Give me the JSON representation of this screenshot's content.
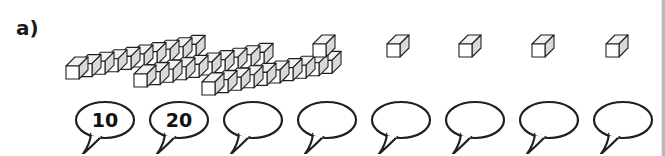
{
  "page": {
    "task_label": "a)",
    "background_color": "#ffffff",
    "line_color": "#231f20",
    "cube_face_top": "#f2f2f2",
    "cube_face_front": "#ffffff",
    "cube_face_side": "#d9d9d9"
  },
  "manipulatives": {
    "rods": [
      {
        "name": "ten-rod-1",
        "cubes": 10,
        "value": 10,
        "x": 60,
        "y": 20
      },
      {
        "name": "ten-rod-2",
        "cubes": 10,
        "value": 10,
        "x": 128,
        "y": 28
      },
      {
        "name": "ten-rod-3",
        "cubes": 10,
        "value": 10,
        "x": 196,
        "y": 36
      }
    ],
    "unit_cubes": [
      {
        "name": "unit-cube-1",
        "value": 1,
        "x": 309,
        "y": 30
      },
      {
        "name": "unit-cube-2",
        "value": 1,
        "x": 383,
        "y": 30
      },
      {
        "name": "unit-cube-3",
        "value": 1,
        "x": 455,
        "y": 30
      },
      {
        "name": "unit-cube-4",
        "value": 1,
        "x": 528,
        "y": 30
      },
      {
        "name": "unit-cube-5",
        "value": 1,
        "x": 602,
        "y": 30
      }
    ]
  },
  "answer_bubbles": [
    {
      "name": "bubble-1",
      "text": "10",
      "x": 74,
      "y": 100,
      "tail": "left"
    },
    {
      "name": "bubble-2",
      "text": "20",
      "x": 148,
      "y": 100,
      "tail": "left"
    },
    {
      "name": "bubble-3",
      "text": "",
      "x": 222,
      "y": 100,
      "tail": "left"
    },
    {
      "name": "bubble-4",
      "text": "",
      "x": 296,
      "y": 100,
      "tail": "left"
    },
    {
      "name": "bubble-5",
      "text": "",
      "x": 370,
      "y": 100,
      "tail": "left"
    },
    {
      "name": "bubble-6",
      "text": "",
      "x": 444,
      "y": 100,
      "tail": "left"
    },
    {
      "name": "bubble-7",
      "text": "",
      "x": 518,
      "y": 100,
      "tail": "left"
    },
    {
      "name": "bubble-8",
      "text": "",
      "x": 592,
      "y": 100,
      "tail": "left"
    }
  ]
}
